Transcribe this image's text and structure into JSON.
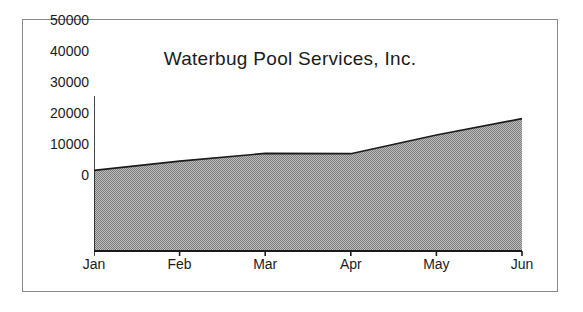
{
  "figure": {
    "background_color": "#ffffff",
    "frame_color": "#8a8a8a"
  },
  "chart_data": {
    "type": "area",
    "title": "Waterbug Pool Services, Inc.",
    "xlabel": "",
    "ylabel": "",
    "categories": [
      "Jan",
      "Feb",
      "Mar",
      "Apr",
      "May",
      "Jun"
    ],
    "values": [
      26000,
      29000,
      31500,
      31400,
      37400,
      42700
    ],
    "series": [
      {
        "name": "Revenue",
        "values": [
          26000,
          29000,
          31500,
          31400,
          37400,
          42700
        ]
      }
    ],
    "ylim": [
      0,
      50000
    ],
    "yticks": [
      0,
      10000,
      20000,
      30000,
      40000,
      50000
    ],
    "ytick_labels": [
      "0",
      "10000",
      "20000",
      "30000",
      "40000",
      "50000"
    ],
    "xtick_labels": [
      "Jan",
      "Feb",
      "Mar",
      "Apr",
      "May",
      "Jun"
    ],
    "grid": false,
    "legend": false,
    "legend_position": "none",
    "area_fill_color": "#9a9a9a",
    "area_fill_pattern": "dither-50",
    "line_color": "#1b1b1b",
    "axis_color": "#1b1b1b"
  }
}
